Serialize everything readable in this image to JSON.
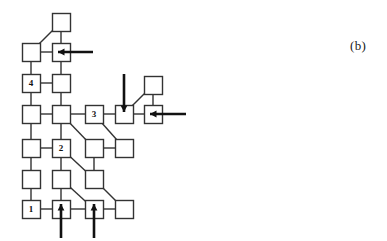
{
  "figure": {
    "caption": "(b)",
    "caption_pos": {
      "x": 350,
      "y": 38
    },
    "type": "node-link-diagram",
    "colors": {
      "stroke": "#333333",
      "arrow": "#111111",
      "background": "#ffffff",
      "text": "#111111"
    },
    "node_size": 18,
    "nodes": [
      {
        "id": "n_c2_r0",
        "x": 52,
        "y": 13,
        "label": ""
      },
      {
        "id": "n_c1_r1",
        "x": 22,
        "y": 43,
        "label": ""
      },
      {
        "id": "n_c2_r1",
        "x": 52,
        "y": 43,
        "label": ""
      },
      {
        "id": "n_c1_r2",
        "x": 22,
        "y": 74,
        "label": "4"
      },
      {
        "id": "n_c2_r2",
        "x": 52,
        "y": 74,
        "label": ""
      },
      {
        "id": "n_c1_r3",
        "x": 22,
        "y": 105,
        "label": ""
      },
      {
        "id": "n_c2_r3",
        "x": 52,
        "y": 105,
        "label": ""
      },
      {
        "id": "n_c3_r3",
        "x": 85,
        "y": 105,
        "label": "3"
      },
      {
        "id": "n_c4_r3",
        "x": 115,
        "y": 105,
        "label": ""
      },
      {
        "id": "n_c5_r3",
        "x": 144,
        "y": 105,
        "label": ""
      },
      {
        "id": "n_c5_r2",
        "x": 144,
        "y": 76,
        "label": ""
      },
      {
        "id": "n_c1_r4",
        "x": 22,
        "y": 139,
        "label": ""
      },
      {
        "id": "n_c2_r4",
        "x": 52,
        "y": 139,
        "label": "2"
      },
      {
        "id": "n_c3_r4",
        "x": 85,
        "y": 139,
        "label": ""
      },
      {
        "id": "n_c4_r4",
        "x": 115,
        "y": 139,
        "label": ""
      },
      {
        "id": "n_c1_r5",
        "x": 22,
        "y": 170,
        "label": ""
      },
      {
        "id": "n_c2_r5",
        "x": 52,
        "y": 170,
        "label": ""
      },
      {
        "id": "n_c3_r5",
        "x": 85,
        "y": 170,
        "label": ""
      },
      {
        "id": "n_c1_r6",
        "x": 22,
        "y": 200,
        "label": "1"
      },
      {
        "id": "n_c2_r6",
        "x": 52,
        "y": 200,
        "label": ""
      },
      {
        "id": "n_c3_r6",
        "x": 85,
        "y": 200,
        "label": ""
      },
      {
        "id": "n_c4_r6",
        "x": 115,
        "y": 200,
        "label": ""
      }
    ],
    "edges": [
      {
        "from": "n_c2_r0",
        "to": "n_c1_r1",
        "kind": "diagonal"
      },
      {
        "from": "n_c1_r1",
        "to": "n_c2_r1",
        "kind": "horizontal"
      },
      {
        "from": "n_c2_r0",
        "to": "n_c2_r1",
        "kind": "vertical"
      },
      {
        "from": "n_c1_r1",
        "to": "n_c1_r2",
        "kind": "vertical"
      },
      {
        "from": "n_c2_r1",
        "to": "n_c2_r2",
        "kind": "vertical"
      },
      {
        "from": "n_c1_r2",
        "to": "n_c2_r2",
        "kind": "horizontal"
      },
      {
        "from": "n_c1_r2",
        "to": "n_c1_r3",
        "kind": "vertical"
      },
      {
        "from": "n_c2_r2",
        "to": "n_c2_r3",
        "kind": "vertical"
      },
      {
        "from": "n_c1_r3",
        "to": "n_c2_r3",
        "kind": "horizontal"
      },
      {
        "from": "n_c2_r3",
        "to": "n_c3_r3",
        "kind": "horizontal"
      },
      {
        "from": "n_c3_r3",
        "to": "n_c4_r3",
        "kind": "horizontal"
      },
      {
        "from": "n_c4_r3",
        "to": "n_c5_r3",
        "kind": "horizontal"
      },
      {
        "from": "n_c5_r2",
        "to": "n_c5_r3",
        "kind": "vertical"
      },
      {
        "from": "n_c5_r2",
        "to": "n_c4_r3",
        "kind": "diagonal"
      },
      {
        "from": "n_c1_r3",
        "to": "n_c1_r4",
        "kind": "vertical"
      },
      {
        "from": "n_c2_r3",
        "to": "n_c2_r4",
        "kind": "vertical"
      },
      {
        "from": "n_c2_r3",
        "to": "n_c3_r4",
        "kind": "diagonal"
      },
      {
        "from": "n_c3_r3",
        "to": "n_c4_r4",
        "kind": "diagonal"
      },
      {
        "from": "n_c1_r4",
        "to": "n_c2_r4",
        "kind": "horizontal"
      },
      {
        "from": "n_c3_r4",
        "to": "n_c4_r4",
        "kind": "horizontal"
      },
      {
        "from": "n_c1_r4",
        "to": "n_c1_r5",
        "kind": "vertical"
      },
      {
        "from": "n_c2_r4",
        "to": "n_c2_r5",
        "kind": "vertical"
      },
      {
        "from": "n_c2_r4",
        "to": "n_c3_r5",
        "kind": "diagonal"
      },
      {
        "from": "n_c3_r4",
        "to": "n_c3_r5",
        "kind": "vertical"
      },
      {
        "from": "n_c1_r5",
        "to": "n_c1_r6",
        "kind": "vertical"
      },
      {
        "from": "n_c2_r5",
        "to": "n_c2_r6",
        "kind": "vertical"
      },
      {
        "from": "n_c2_r5",
        "to": "n_c3_r6",
        "kind": "diagonal"
      },
      {
        "from": "n_c3_r5",
        "to": "n_c4_r6",
        "kind": "diagonal"
      },
      {
        "from": "n_c1_r6",
        "to": "n_c2_r6",
        "kind": "horizontal"
      },
      {
        "from": "n_c2_r6",
        "to": "n_c3_r6",
        "kind": "horizontal"
      },
      {
        "from": "n_c3_r6",
        "to": "n_c4_r6",
        "kind": "horizontal"
      }
    ],
    "arrows": [
      {
        "id": "arrow-left-top",
        "direction": "left",
        "target": "n_c2_r1",
        "tail": {
          "x": 93,
          "y": 52
        },
        "head": {
          "x": 58,
          "y": 52
        }
      },
      {
        "id": "arrow-left-right",
        "direction": "left",
        "target": "n_c5_r3",
        "tail": {
          "x": 186,
          "y": 114
        },
        "head": {
          "x": 150,
          "y": 114
        }
      },
      {
        "id": "arrow-down-mid",
        "direction": "down",
        "target": "n_c4_r3",
        "tail": {
          "x": 124,
          "y": 74
        },
        "head": {
          "x": 124,
          "y": 112
        }
      },
      {
        "id": "arrow-up-left",
        "direction": "up",
        "target": "n_c2_r6",
        "tail": {
          "x": 61,
          "y": 238
        },
        "head": {
          "x": 61,
          "y": 204
        }
      },
      {
        "id": "arrow-up-right",
        "direction": "up",
        "target": "n_c3_r6",
        "tail": {
          "x": 94,
          "y": 238
        },
        "head": {
          "x": 94,
          "y": 204
        }
      }
    ]
  }
}
